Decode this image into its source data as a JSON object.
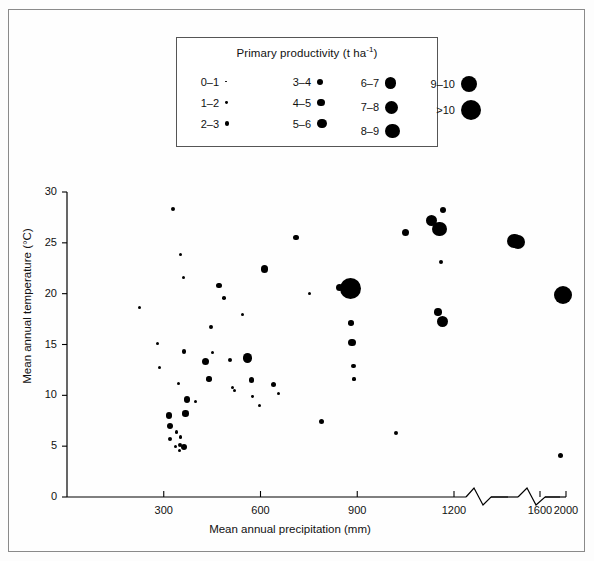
{
  "figure": {
    "background": "#ffffff",
    "ink": "#000000",
    "frame_color": "#8a8a8a"
  },
  "legend": {
    "title_main": "Primary productivity (t ha",
    "title_sup": "-1",
    "title_tail": ")",
    "title_full": "Primary productivity (t ha-1)",
    "columns": [
      {
        "entries": [
          {
            "label": "0–1",
            "size_px": 1.6
          },
          {
            "label": "1–2",
            "size_px": 2.8
          },
          {
            "label": "2–3",
            "size_px": 4.2
          }
        ]
      },
      {
        "entries": [
          {
            "label": "3–4",
            "size_px": 6.0
          },
          {
            "label": "4–5",
            "size_px": 7.6
          },
          {
            "label": "5–6",
            "size_px": 9.6
          }
        ]
      },
      {
        "entries": [
          {
            "label": "6–7",
            "size_px": 11.4
          },
          {
            "label": "7–8",
            "size_px": 13.0
          },
          {
            "label": "8–9",
            "size_px": 14.6
          }
        ]
      },
      {
        "entries": [
          {
            "label": "9–10",
            "size_px": 16.4
          },
          {
            "label": ">10",
            "size_px": 20.0
          }
        ]
      }
    ]
  },
  "chart_data": {
    "type": "scatter",
    "title": "",
    "xlabel": "Mean annual precipitation (mm)",
    "ylabel": "Mean annual temperature (°C)",
    "legend_title": "Primary productivity (t ha-1)",
    "legend_position": "top-center",
    "grid": false,
    "size_encodes": "Primary productivity (t ha-1)",
    "xlim": [
      0,
      2000
    ],
    "ylim": [
      0,
      30
    ],
    "xticks": [
      300,
      600,
      900,
      1200,
      1600,
      2000
    ],
    "yticks": [
      0,
      5,
      10,
      15,
      20,
      25,
      30
    ],
    "axis_breaks": [
      {
        "after_tick": 1200,
        "note": "zigzag break between 1200 and 1600"
      },
      {
        "after_tick": 1600,
        "note": "zigzag break between 1600 and 2000"
      }
    ],
    "points": [
      {
        "x": 225,
        "y": 18.6,
        "size": 3.0,
        "productivity_class": "1–2"
      },
      {
        "x": 280,
        "y": 15.1,
        "size": 3.4,
        "productivity_class": "1–2"
      },
      {
        "x": 288,
        "y": 12.7,
        "size": 3.0,
        "productivity_class": "1–2"
      },
      {
        "x": 328,
        "y": 28.3,
        "size": 4.2,
        "productivity_class": "2–3"
      },
      {
        "x": 352,
        "y": 23.9,
        "size": 3.0,
        "productivity_class": "1–2"
      },
      {
        "x": 360,
        "y": 21.6,
        "size": 3.0,
        "productivity_class": "1–2"
      },
      {
        "x": 362,
        "y": 14.3,
        "size": 4.4,
        "productivity_class": "2–3"
      },
      {
        "x": 345,
        "y": 11.2,
        "size": 3.2,
        "productivity_class": "1–2"
      },
      {
        "x": 316,
        "y": 8.0,
        "size": 6.6,
        "productivity_class": "3–4"
      },
      {
        "x": 320,
        "y": 7.0,
        "size": 6.0,
        "productivity_class": "3–4"
      },
      {
        "x": 318,
        "y": 5.7,
        "size": 4.0,
        "productivity_class": "2–3"
      },
      {
        "x": 340,
        "y": 6.4,
        "size": 3.2,
        "productivity_class": "1–2"
      },
      {
        "x": 336,
        "y": 5.0,
        "size": 3.0,
        "productivity_class": "1–2"
      },
      {
        "x": 350,
        "y": 5.1,
        "size": 4.6,
        "productivity_class": "2–3"
      },
      {
        "x": 352,
        "y": 5.9,
        "size": 3.4,
        "productivity_class": "1–2"
      },
      {
        "x": 348,
        "y": 4.6,
        "size": 3.0,
        "productivity_class": "1–2"
      },
      {
        "x": 362,
        "y": 4.9,
        "size": 6.0,
        "productivity_class": "3–4"
      },
      {
        "x": 368,
        "y": 8.2,
        "size": 6.4,
        "productivity_class": "3–4"
      },
      {
        "x": 372,
        "y": 9.6,
        "size": 6.8,
        "productivity_class": "3–4"
      },
      {
        "x": 398,
        "y": 9.4,
        "size": 3.2,
        "productivity_class": "1–2"
      },
      {
        "x": 430,
        "y": 13.3,
        "size": 7.2,
        "productivity_class": "4–5"
      },
      {
        "x": 440,
        "y": 11.6,
        "size": 5.4,
        "productivity_class": "3–4"
      },
      {
        "x": 447,
        "y": 16.7,
        "size": 3.8,
        "productivity_class": "2–3"
      },
      {
        "x": 452,
        "y": 14.2,
        "size": 3.2,
        "productivity_class": "1–2"
      },
      {
        "x": 472,
        "y": 20.8,
        "size": 5.6,
        "productivity_class": "3–4"
      },
      {
        "x": 486,
        "y": 19.6,
        "size": 3.6,
        "productivity_class": "2–3"
      },
      {
        "x": 505,
        "y": 13.5,
        "size": 4.4,
        "productivity_class": "2–3"
      },
      {
        "x": 513,
        "y": 10.8,
        "size": 3.0,
        "productivity_class": "1–2"
      },
      {
        "x": 520,
        "y": 10.5,
        "size": 3.2,
        "productivity_class": "1–2"
      },
      {
        "x": 545,
        "y": 18.0,
        "size": 3.0,
        "productivity_class": "1–2"
      },
      {
        "x": 560,
        "y": 13.7,
        "size": 9.8,
        "productivity_class": "5–6"
      },
      {
        "x": 572,
        "y": 11.5,
        "size": 5.6,
        "productivity_class": "3–4"
      },
      {
        "x": 575,
        "y": 9.9,
        "size": 2.8,
        "productivity_class": "1–2"
      },
      {
        "x": 596,
        "y": 9.0,
        "size": 3.2,
        "productivity_class": "1–2"
      },
      {
        "x": 612,
        "y": 22.4,
        "size": 7.6,
        "productivity_class": "4–5"
      },
      {
        "x": 640,
        "y": 11.1,
        "size": 5.0,
        "productivity_class": "2–3"
      },
      {
        "x": 655,
        "y": 10.2,
        "size": 3.0,
        "productivity_class": "1–2"
      },
      {
        "x": 710,
        "y": 25.5,
        "size": 5.4,
        "productivity_class": "3–4"
      },
      {
        "x": 752,
        "y": 20.0,
        "size": 3.0,
        "productivity_class": "1–2"
      },
      {
        "x": 790,
        "y": 7.4,
        "size": 5.0,
        "productivity_class": "2–3"
      },
      {
        "x": 845,
        "y": 20.6,
        "size": 7.6,
        "productivity_class": "4–5"
      },
      {
        "x": 878,
        "y": 20.5,
        "size": 21.0,
        "productivity_class": ">10"
      },
      {
        "x": 880,
        "y": 17.1,
        "size": 5.6,
        "productivity_class": "3–4"
      },
      {
        "x": 884,
        "y": 15.2,
        "size": 7.4,
        "productivity_class": "4–5"
      },
      {
        "x": 888,
        "y": 12.9,
        "size": 4.6,
        "productivity_class": "2–3"
      },
      {
        "x": 890,
        "y": 11.6,
        "size": 3.2,
        "productivity_class": "1–2"
      },
      {
        "x": 1020,
        "y": 6.3,
        "size": 4.4,
        "productivity_class": "2–3"
      },
      {
        "x": 1050,
        "y": 26.0,
        "size": 7.6,
        "productivity_class": "4–5"
      },
      {
        "x": 1130,
        "y": 27.2,
        "size": 11.8,
        "productivity_class": "6–7"
      },
      {
        "x": 1165,
        "y": 28.2,
        "size": 6.4,
        "productivity_class": "3–4"
      },
      {
        "x": 1155,
        "y": 26.4,
        "size": 14.2,
        "productivity_class": "8–9"
      },
      {
        "x": 1160,
        "y": 23.1,
        "size": 4.4,
        "productivity_class": "2–3"
      },
      {
        "x": 1150,
        "y": 18.2,
        "size": 7.6,
        "productivity_class": "4–5"
      },
      {
        "x": 1165,
        "y": 17.3,
        "size": 11.0,
        "productivity_class": "6–7"
      },
      {
        "x": 1280,
        "y": 25.2,
        "size": 14.4,
        "productivity_class": "8–9"
      },
      {
        "x": 1330,
        "y": 25.1,
        "size": 14.0,
        "productivity_class": "8–9"
      },
      {
        "x": 1640,
        "y": 4.1,
        "size": 5.6,
        "productivity_class": "3–4"
      },
      {
        "x": 1800,
        "y": 19.9,
        "size": 18.0,
        "productivity_class": "9–10"
      }
    ]
  }
}
